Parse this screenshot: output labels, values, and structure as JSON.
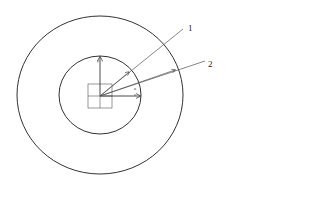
{
  "diagram": {
    "type": "concentric-circles-with-vectors",
    "labels": {
      "line1": "1",
      "line2": "2",
      "axis_y": "y",
      "axis_x": "x",
      "angle": "α"
    },
    "colors": {
      "stroke": "#333333",
      "background": "#ffffff"
    }
  }
}
